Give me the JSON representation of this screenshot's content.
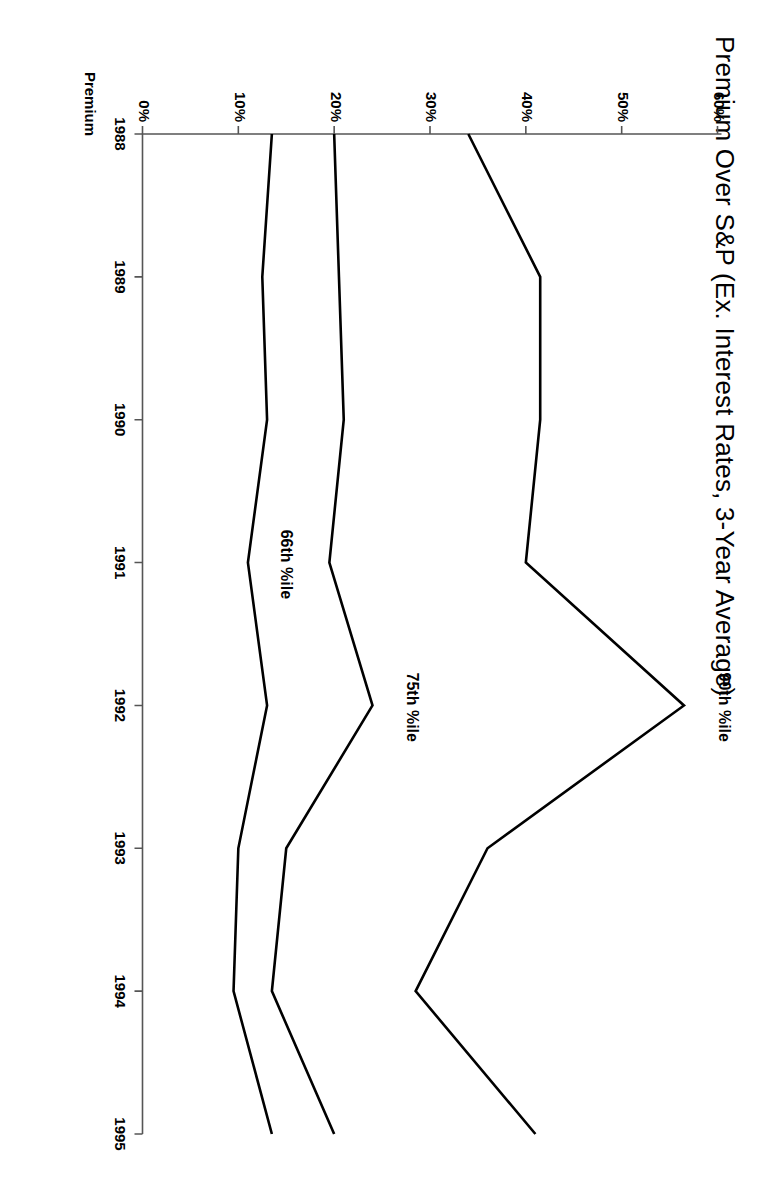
{
  "chart_data": {
    "type": "line",
    "title": "Premium Over S&P (Ex. Interest Rates, 3-Year Average)",
    "xlabel": "",
    "ylabel": "Premium",
    "x": [
      1988,
      1989,
      1990,
      1991,
      1992,
      1993,
      1994,
      1995
    ],
    "xtick_labels": [
      "1988",
      "1989",
      "1990",
      "1991",
      "1992",
      "1993",
      "1994",
      "1995"
    ],
    "ytick_labels": [
      "0%",
      "10%",
      "20%",
      "30%",
      "40%",
      "50%",
      "60%"
    ],
    "ytick_values": [
      0,
      10,
      20,
      30,
      40,
      50,
      60
    ],
    "ylim": [
      0,
      60
    ],
    "xlim": [
      1988,
      1995
    ],
    "grid": false,
    "legend": "inline-annotations",
    "series": [
      {
        "name": "90th %ile",
        "label": "90th %ile",
        "color": "#000000",
        "values": [
          34,
          41.5,
          41.5,
          40,
          56.5,
          36,
          28.5,
          41
        ]
      },
      {
        "name": "75th %ile",
        "label": "75th %ile",
        "color": "#000000",
        "values": [
          20,
          20.5,
          21,
          19.5,
          24,
          15,
          13.5,
          20
        ]
      },
      {
        "name": "66th %ile",
        "label": "66th %ile",
        "color": "#000000",
        "values": [
          13.5,
          12.5,
          13,
          11,
          13,
          10,
          9.5,
          13.5
        ]
      }
    ]
  },
  "annotations": {
    "series_0_label": "90th %ile",
    "series_1_label": "75th %ile",
    "series_2_label": "66th %ile"
  },
  "axis": {
    "y_axis_title": "Premium"
  }
}
